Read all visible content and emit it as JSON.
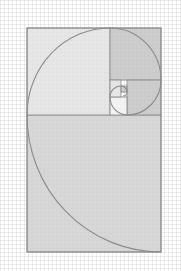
{
  "diagram": {
    "title": "",
    "type": "golden-spiral",
    "colors": {
      "background": "#ffffff",
      "grid": "#e4e4e4",
      "square_light": "#e2e2e2",
      "square_mid": "#d0d0d0",
      "square_dark": "#c4c4c4",
      "square_white": "#f1f1f1",
      "outline": "#8a8a8a",
      "spiral": "#8c8c8c"
    },
    "outer_rect": {
      "x": 27,
      "y": 28,
      "w": 134,
      "h": 224
    },
    "squares": [
      {
        "name": "bottom-square",
        "x": 27,
        "y": 115,
        "w": 134,
        "h": 137,
        "shade": "square_mid"
      },
      {
        "name": "top-left-square",
        "x": 27,
        "y": 28,
        "w": 83,
        "h": 87,
        "shade": "square_light"
      },
      {
        "name": "top-right-square",
        "x": 110,
        "y": 28,
        "w": 51,
        "h": 52,
        "shade": "square_dark"
      },
      {
        "name": "right-middle-square",
        "x": 127,
        "y": 80,
        "w": 34,
        "h": 35,
        "shade": "square_dark"
      },
      {
        "name": "center-bottom-square",
        "x": 110,
        "y": 97,
        "w": 17,
        "h": 18,
        "shade": "square_white"
      },
      {
        "name": "center-left-square",
        "x": 110,
        "y": 80,
        "w": 11,
        "h": 17,
        "shade": "square_light"
      },
      {
        "name": "center-tiny-square",
        "x": 121,
        "y": 86,
        "w": 6,
        "h": 6,
        "shade": "square_dark"
      }
    ]
  }
}
